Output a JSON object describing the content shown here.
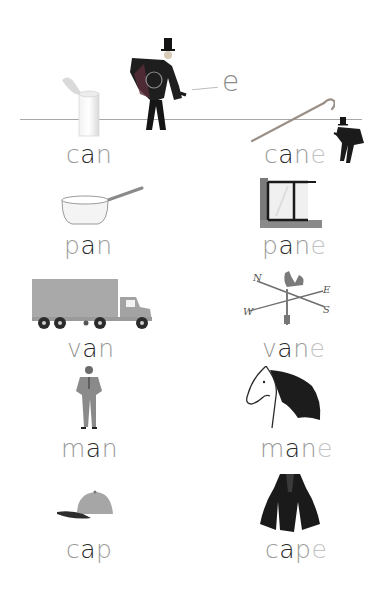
{
  "page": {
    "background": "#ffffff",
    "title_scene": {
      "magic_letter": "e",
      "baseline_color": "#9e9e9e"
    }
  },
  "colors": {
    "consonant": "#9a9a9a",
    "vowel": "#2a2a2a",
    "silent_e": "#c3c3c3"
  },
  "pairs": [
    {
      "left": {
        "word": "can",
        "letters": [
          "c",
          "a",
          "n"
        ],
        "picture": "tin-can-icon"
      },
      "right": {
        "word": "cane",
        "letters": [
          "c",
          "a",
          "n",
          "e"
        ],
        "picture": "walking-cane-icon"
      }
    },
    {
      "left": {
        "word": "pan",
        "letters": [
          "p",
          "a",
          "n"
        ],
        "picture": "saucepan-icon"
      },
      "right": {
        "word": "pane",
        "letters": [
          "p",
          "a",
          "n",
          "e"
        ],
        "picture": "window-pane-icon"
      }
    },
    {
      "left": {
        "word": "van",
        "letters": [
          "v",
          "a",
          "n"
        ],
        "picture": "truck-icon"
      },
      "right": {
        "word": "vane",
        "letters": [
          "v",
          "a",
          "n",
          "e"
        ],
        "picture": "weather-vane-icon"
      }
    },
    {
      "left": {
        "word": "man",
        "letters": [
          "m",
          "a",
          "n"
        ],
        "picture": "man-in-suit-icon"
      },
      "right": {
        "word": "mane",
        "letters": [
          "m",
          "a",
          "n",
          "e"
        ],
        "picture": "horse-mane-icon"
      }
    },
    {
      "left": {
        "word": "cap",
        "letters": [
          "c",
          "a",
          "p"
        ],
        "picture": "baseball-cap-icon"
      },
      "right": {
        "word": "cape",
        "letters": [
          "c",
          "a",
          "p",
          "e"
        ],
        "picture": "cape-cloak-icon"
      }
    }
  ],
  "weather_vane": {
    "directions": [
      "N",
      "E",
      "S",
      "W"
    ]
  }
}
